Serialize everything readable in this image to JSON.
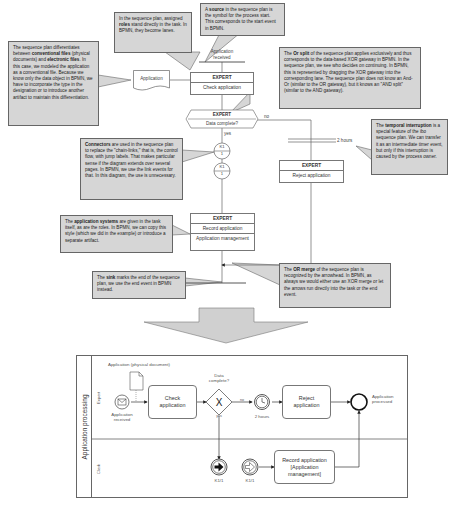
{
  "sequence_plan": {
    "start_event_label": "Application received",
    "document_label": "Application",
    "task_check": {
      "role": "EXPERT",
      "name": "Check application"
    },
    "decision": {
      "role": "EXPERT",
      "question": "Data complete?",
      "yes_label": "yes",
      "no_label": "no"
    },
    "connector_top": {
      "top": "K1",
      "bottom": "1"
    },
    "connector_bottom": {
      "top": "K1",
      "bottom": "1"
    },
    "timer_label": "2 hours",
    "task_reject": {
      "role": "EXPERT",
      "name": "Reject application"
    },
    "task_record": {
      "role": "EXPERT",
      "name": "Record application",
      "system": "Application management"
    }
  },
  "callouts": {
    "roles": {
      "pre": "In the sequence plan, assigned ",
      "bold": "roles",
      "post": " stand directly in the task. In BPMN, they become lanes."
    },
    "source": {
      "pre": "A ",
      "bold": "source",
      "post": " in the sequence plan is the symbol for the process start. This corresponds to the start event in BPMN."
    },
    "files": {
      "pre": "The sequence plan differentiates between ",
      "bold": "conventional files",
      "mid": " (physical documents) and ",
      "bold2": "electronic files",
      "post": ". In this case, we modeled the application as a conventional file. Because we know only the data object in BPMN, we have to incorporate the type in the designation or to introduce another artifact to maintain this differentiation."
    },
    "or_split": {
      "pre": "The ",
      "bold": "Or split",
      "post": " of the sequence plan applies exclusively and thus corresponds to the data-based XOR gateway in BPMN. In the sequence plan, we see who decides on continuing. In BPMN, this is represented by dragging the XOR gateway into the corresponding lane. The sequence plan does not know an And-Or (similar to the OR gateway), but it knows an \"AND split\" (similar to the AND gateway)."
    },
    "connectors": {
      "pre": "",
      "bold": "Connectors",
      "post": " are used in the sequence plan to replace the \"chain-links,\" that is, the control flow, with jump labels. That makes particular sense if the diagram extends over several pages. In BPMN, we use the link events for that. In this diagram, the use is unnecessary."
    },
    "temporal": {
      "pre": "The ",
      "bold": "temporal interruption",
      "post": " is a special feature of the ibo sequence plan. We can transfer it as an intermediate timer event, but only if this interruption is caused by the process owner."
    },
    "app_systems": {
      "pre": "The ",
      "bold": "application systems",
      "post": " are given in the task itself, as are the roles. In BPMN, we can copy this style (which we did in the example) or introduce a separate artifact."
    },
    "sink": {
      "pre": "The ",
      "bold": "sink",
      "post": " marks the end of the sequence plan, we use the end event in BPMN instead."
    },
    "or_merge": {
      "pre": "The ",
      "bold": "OR merge",
      "post": " of the sequence plan is recognized by the arrowhead. In BPMN, as always we would either use an XOR merge or let the arrows run directly into the task or the end event."
    }
  },
  "bpmn": {
    "pool_label": "Application processing",
    "lanes": [
      "Expert",
      "Clerk"
    ],
    "data_object_label": "Application (physical document)",
    "start_event_label": "Application received",
    "task_check": "Check application",
    "gateway_label": "Data complete?",
    "gateway_yes": "yes",
    "gateway_no": "no",
    "timer_label": "2 hours",
    "task_reject": "Reject application",
    "end_event_label": "Application processed",
    "link_throw_label": "K1/1",
    "link_catch_label": "K1/1",
    "task_record": "Record application [Application management]"
  },
  "colors": {
    "callout_bg": "#d6d6d6",
    "line": "#666666",
    "arrow_fill": "#d0d0d0"
  }
}
